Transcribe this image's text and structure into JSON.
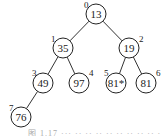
{
  "diagram": {
    "type": "binary-heap-tree",
    "nodes": [
      {
        "index": "0",
        "value": "13",
        "x": 96,
        "y": 14,
        "ix": 84,
        "iy": 8
      },
      {
        "index": "1",
        "value": "35",
        "x": 63,
        "y": 48,
        "ix": 51,
        "iy": 42
      },
      {
        "index": "2",
        "value": "19",
        "x": 129,
        "y": 48,
        "ix": 139,
        "iy": 42
      },
      {
        "index": "3",
        "value": "49",
        "x": 43,
        "y": 83,
        "ix": 32,
        "iy": 76
      },
      {
        "index": "4",
        "value": "97",
        "x": 79,
        "y": 83,
        "ix": 89,
        "iy": 76
      },
      {
        "index": "5",
        "value": "81*",
        "x": 116,
        "y": 83,
        "ix": 104,
        "iy": 76
      },
      {
        "index": "6",
        "value": "81",
        "x": 146,
        "y": 83,
        "ix": 156,
        "iy": 76
      },
      {
        "index": "7",
        "value": "76",
        "x": 21,
        "y": 117,
        "ix": 9,
        "iy": 111
      }
    ],
    "edges": [
      [
        0,
        1
      ],
      [
        0,
        2
      ],
      [
        1,
        3
      ],
      [
        1,
        4
      ],
      [
        2,
        5
      ],
      [
        2,
        6
      ],
      [
        3,
        7
      ]
    ],
    "caption": "图 1.17 ··· ·· ·· ·· ·· ·· ·· ·· ·· ··"
  }
}
